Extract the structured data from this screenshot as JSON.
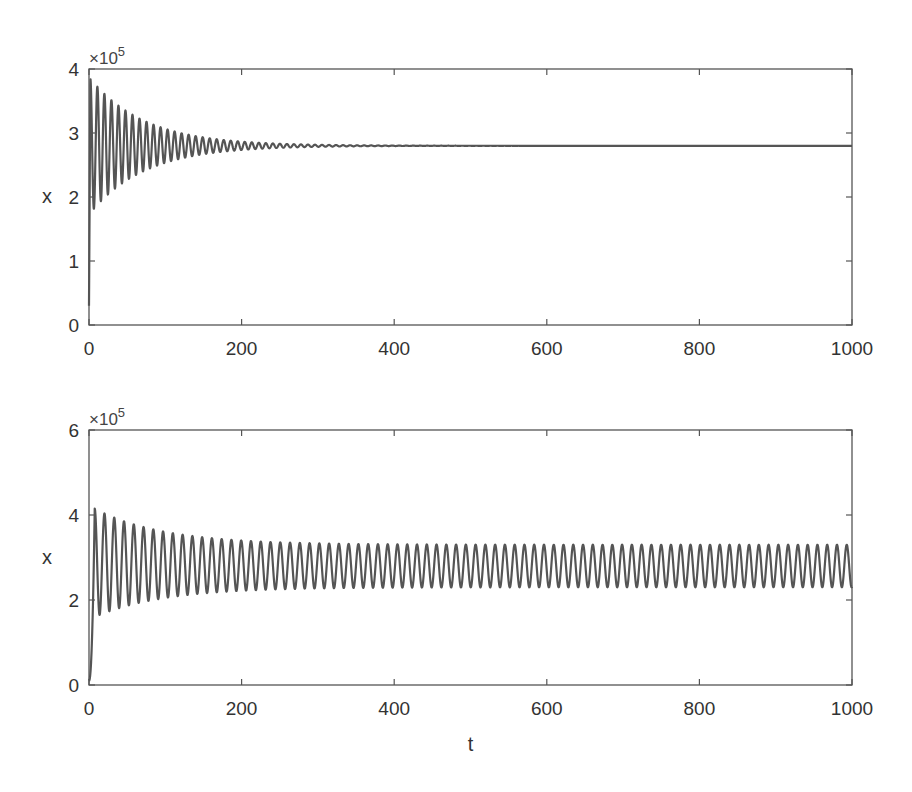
{
  "chart_data": [
    {
      "type": "line",
      "title": "",
      "xlabel": "",
      "ylabel": "x",
      "y_multiplier_label": "×10",
      "y_multiplier_exp": "5",
      "xlim": [
        0,
        1000
      ],
      "ylim": [
        0,
        4
      ],
      "x_ticks": [
        "0",
        "200",
        "400",
        "600",
        "800",
        "1000"
      ],
      "y_ticks": [
        "0",
        "1",
        "2",
        "3",
        "4"
      ],
      "grid": false,
      "legend": null,
      "series": [
        {
          "name": "x(t)",
          "description": "Damped oscillation converging to stable equilibrium",
          "initial_value": 0.3,
          "first_peak": 3.85,
          "first_trough": 1.85,
          "equilibrium": 2.8,
          "period_t": 9.2,
          "decay_time_t": 300,
          "color": "#555555"
        }
      ]
    },
    {
      "type": "line",
      "title": "",
      "xlabel": "t",
      "ylabel": "x",
      "y_multiplier_label": "×10",
      "y_multiplier_exp": "5",
      "xlim": [
        0,
        1000
      ],
      "ylim": [
        0,
        6
      ],
      "x_ticks": [
        "0",
        "200",
        "400",
        "600",
        "800",
        "1000"
      ],
      "y_ticks": [
        "0",
        "2",
        "4",
        "6"
      ],
      "grid": false,
      "legend": null,
      "series": [
        {
          "name": "x(t)",
          "description": "Oscillation converging to a stable limit cycle",
          "initial_value": 0.1,
          "first_peak": 4.15,
          "first_trough": 1.6,
          "limit_cycle_max": 3.3,
          "limit_cycle_min": 2.3,
          "period_t": 12.8,
          "color": "#555555"
        }
      ]
    }
  ],
  "layout": {
    "axes": [
      {
        "left": 89,
        "top": 69,
        "right": 852,
        "bottom": 325
      },
      {
        "left": 89,
        "top": 430,
        "right": 852,
        "bottom": 685
      }
    ],
    "axis_color": "#555555",
    "text_color": "#333333"
  }
}
